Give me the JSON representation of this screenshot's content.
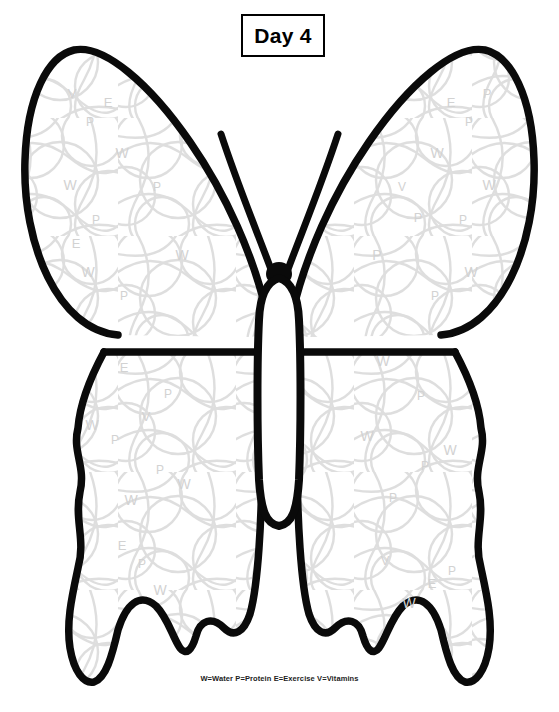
{
  "page": {
    "title": "Day 4",
    "background_color": "#ffffff",
    "width": 559,
    "height": 712
  },
  "header": {
    "day_label": "Day 4",
    "box_border_color": "#000000",
    "box_fill_color": "#ffffff"
  },
  "legend": {
    "text": "W=Water P=Protein E=Exercise V=Vitamins",
    "entries": [
      {
        "letter": "W",
        "meaning": "Water"
      },
      {
        "letter": "P",
        "meaning": "Protein"
      },
      {
        "letter": "E",
        "meaning": "Exercise"
      },
      {
        "letter": "V",
        "meaning": "Vitamins"
      }
    ]
  },
  "artwork": {
    "subject": "butterfly",
    "outline_color": "#0a0a0a",
    "fill_color": "#ffffff",
    "pattern_color": "#dcdcdc",
    "letter_color": "#d2d2d2",
    "description": "Butterfly coloring outline with faint overlapping circle pattern and scattered habit letters"
  },
  "pattern_letters": {
    "upper_left_wing": [
      {
        "ch": "V",
        "x": 72,
        "y": 98,
        "size": 13
      },
      {
        "ch": "E",
        "x": 108,
        "y": 107,
        "size": 13
      },
      {
        "ch": "P",
        "x": 90,
        "y": 126,
        "size": 12
      },
      {
        "ch": "W",
        "x": 122,
        "y": 158,
        "size": 14
      },
      {
        "ch": "W",
        "x": 70,
        "y": 190,
        "size": 14
      },
      {
        "ch": "P",
        "x": 157,
        "y": 191,
        "size": 12
      },
      {
        "ch": "P",
        "x": 96,
        "y": 224,
        "size": 12
      },
      {
        "ch": "E",
        "x": 76,
        "y": 248,
        "size": 13
      },
      {
        "ch": "W",
        "x": 182,
        "y": 260,
        "size": 14
      },
      {
        "ch": "W",
        "x": 88,
        "y": 277,
        "size": 14
      },
      {
        "ch": "P",
        "x": 124,
        "y": 300,
        "size": 12
      }
    ],
    "upper_right_wing": [
      {
        "ch": "P",
        "x": 487,
        "y": 98,
        "size": 13
      },
      {
        "ch": "E",
        "x": 451,
        "y": 107,
        "size": 13
      },
      {
        "ch": "P",
        "x": 469,
        "y": 126,
        "size": 12
      },
      {
        "ch": "W",
        "x": 437,
        "y": 158,
        "size": 14
      },
      {
        "ch": "W",
        "x": 489,
        "y": 190,
        "size": 14
      },
      {
        "ch": "V",
        "x": 402,
        "y": 191,
        "size": 12
      },
      {
        "ch": "P",
        "x": 463,
        "y": 224,
        "size": 12
      },
      {
        "ch": "P",
        "x": 418,
        "y": 222,
        "size": 13
      },
      {
        "ch": "P",
        "x": 377,
        "y": 260,
        "size": 14
      },
      {
        "ch": "W",
        "x": 471,
        "y": 277,
        "size": 14
      },
      {
        "ch": "P",
        "x": 435,
        "y": 300,
        "size": 12
      }
    ],
    "lower_left_wing": [
      {
        "ch": "E",
        "x": 124,
        "y": 372,
        "size": 13
      },
      {
        "ch": "P",
        "x": 168,
        "y": 398,
        "size": 12
      },
      {
        "ch": "W",
        "x": 92,
        "y": 430,
        "size": 14
      },
      {
        "ch": "V",
        "x": 146,
        "y": 421,
        "size": 13
      },
      {
        "ch": "P",
        "x": 115,
        "y": 444,
        "size": 12
      },
      {
        "ch": "P",
        "x": 160,
        "y": 474,
        "size": 12
      },
      {
        "ch": "W",
        "x": 184,
        "y": 489,
        "size": 14
      },
      {
        "ch": "W",
        "x": 131,
        "y": 505,
        "size": 14
      },
      {
        "ch": "E",
        "x": 122,
        "y": 550,
        "size": 13
      },
      {
        "ch": "P",
        "x": 142,
        "y": 568,
        "size": 12
      },
      {
        "ch": "W",
        "x": 160,
        "y": 595,
        "size": 14
      }
    ],
    "lower_right_wing": [
      {
        "ch": "W",
        "x": 383,
        "y": 366,
        "size": 14
      },
      {
        "ch": "P",
        "x": 421,
        "y": 400,
        "size": 12
      },
      {
        "ch": "W",
        "x": 367,
        "y": 441,
        "size": 14
      },
      {
        "ch": "W",
        "x": 450,
        "y": 455,
        "size": 14
      },
      {
        "ch": "P",
        "x": 425,
        "y": 470,
        "size": 12
      },
      {
        "ch": "P",
        "x": 393,
        "y": 502,
        "size": 12
      },
      {
        "ch": "V",
        "x": 385,
        "y": 565,
        "size": 13
      },
      {
        "ch": "P",
        "x": 452,
        "y": 575,
        "size": 12
      },
      {
        "ch": "E",
        "x": 432,
        "y": 588,
        "size": 13
      },
      {
        "ch": "W",
        "x": 409,
        "y": 608,
        "size": 14
      }
    ]
  }
}
